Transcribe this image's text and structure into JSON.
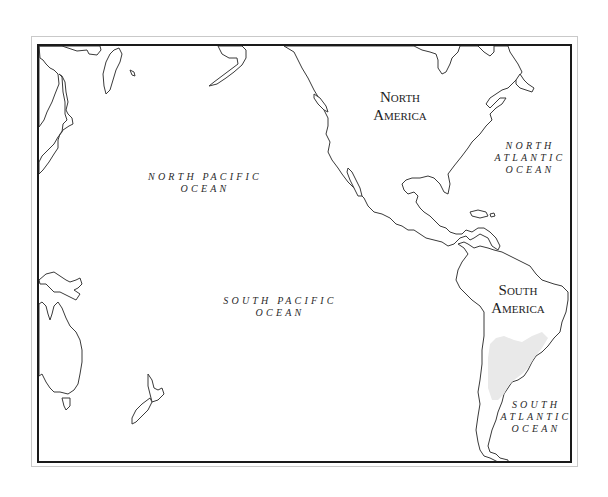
{
  "map": {
    "title": "",
    "frame": {
      "outer_border_color": "#c9c9c9",
      "inner_border_color": "#1a1a1a"
    },
    "shading_color": "#e9e9e9",
    "labels": {
      "north_america": {
        "line1": "North",
        "line2": "America"
      },
      "south_america": {
        "line1": "South",
        "line2": "America"
      },
      "north_pacific": {
        "line1": "NORTH PACIFIC",
        "line2": "OCEAN"
      },
      "south_pacific": {
        "line1": "SOUTH PACIFIC",
        "line2": "OCEAN"
      },
      "north_atlantic": {
        "line1": "NORTH",
        "line2": "ATLANTIC",
        "line3": "OCEAN"
      },
      "south_atlantic": {
        "line1": "SOUTH",
        "line2": "ATLANTIC",
        "line3": "OCEAN"
      }
    },
    "landmasses": [
      "North America",
      "Central America",
      "Caribbean islands",
      "South America",
      "East Asia",
      "Japan",
      "Sakhalin",
      "Alaska peninsula",
      "New Guinea",
      "Australia",
      "Tasmania",
      "New Zealand"
    ],
    "highlighted_region": "Southern South America (shaded interior)"
  }
}
